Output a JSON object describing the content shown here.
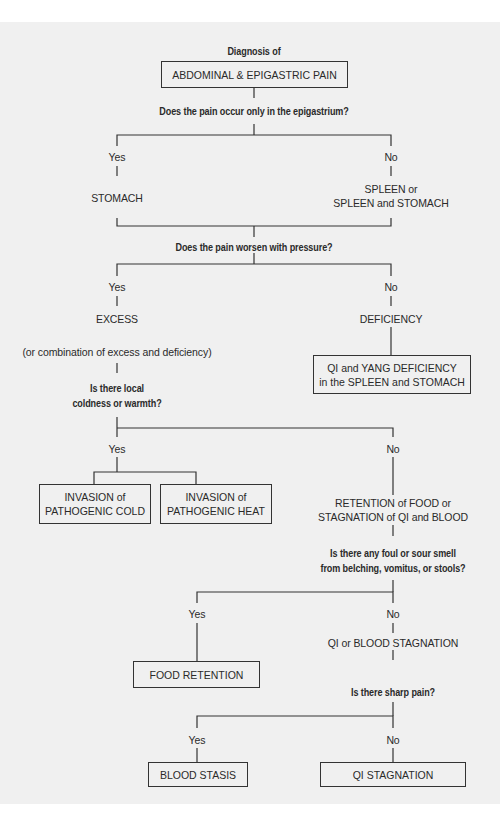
{
  "diagram": {
    "title": "Diagnosis of",
    "root": "ABDOMINAL & EPIGASTRIC PAIN",
    "q1": "Does the pain occur only in the epigastrium?",
    "q1_yes": "Yes",
    "q1_no": "No",
    "q1_yes_result": "STOMACH",
    "q1_no_result_line1": "SPLEEN or",
    "q1_no_result_line2": "SPLEEN and STOMACH",
    "q2": "Does the pain worsen with pressure?",
    "q2_yes": "Yes",
    "q2_no": "No",
    "excess": "EXCESS",
    "excess_note": "(or combination of excess and deficiency)",
    "deficiency": "DEFICIENCY",
    "deficiency_box_line1": "QI and YANG DEFICIENCY",
    "deficiency_box_line2": "in the SPLEEN and STOMACH",
    "q3_line1": "Is there local",
    "q3_line2": "coldness or warmth?",
    "q3_yes": "Yes",
    "q3_no": "No",
    "cold_box_line1": "INVASION of",
    "cold_box_line2": "PATHOGENIC COLD",
    "heat_box_line1": "INVASION of",
    "heat_box_line2": "PATHOGENIC HEAT",
    "retention_line1": "RETENTION of FOOD or",
    "retention_line2": "STAGNATION of QI and BLOOD",
    "q4_line1": "Is there any foul or sour smell",
    "q4_line2": "from belching, vomitus, or stools?",
    "q4_yes": "Yes",
    "q4_no": "No",
    "food_retention": "FOOD RETENTION",
    "qi_blood_stagnation": "QI or BLOOD STAGNATION",
    "q5": "Is there sharp pain?",
    "q5_yes": "Yes",
    "q5_no": "No",
    "blood_stasis": "BLOOD STASIS",
    "qi_stagnation": "QI STAGNATION"
  },
  "colors": {
    "background": "#f0f0f0",
    "page": "#ffffff",
    "line": "#333333",
    "text": "#2a2a2a"
  }
}
